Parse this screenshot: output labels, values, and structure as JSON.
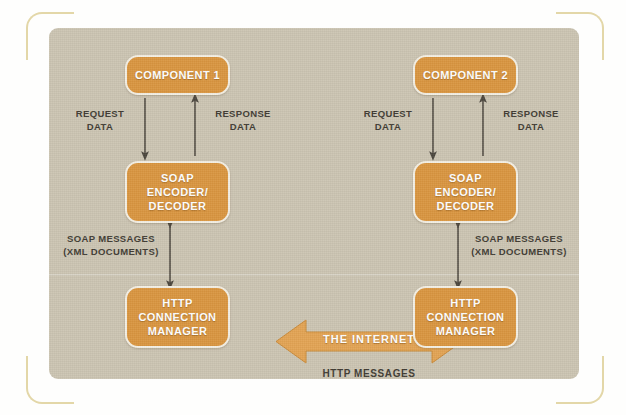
{
  "figure": {
    "background_color": "#cbc4b2",
    "node_color": "#d9953f",
    "node_border_color": "#f4efe3",
    "bracket_color": "#e3d7a8",
    "text_color": "#403b33",
    "node_text_color": "#ffffff"
  },
  "nodes": {
    "component_1": {
      "line1": "COMPONENT 1"
    },
    "component_2": {
      "line1": "COMPONENT 2"
    },
    "soap_left": {
      "line1": "SOAP",
      "line2": "ENCODER/",
      "line3": "DECODER"
    },
    "soap_right": {
      "line1": "SOAP",
      "line2": "ENCODER/",
      "line3": "DECODER"
    },
    "http_left": {
      "line1": "HTTP",
      "line2": "CONNECTION",
      "line3": "MANAGER"
    },
    "http_right": {
      "line1": "HTTP",
      "line2": "CONNECTION",
      "line3": "MANAGER"
    }
  },
  "labels": {
    "request_left": "REQUEST\nDATA",
    "response_left": "RESPONSE\nDATA",
    "request_right": "REQUEST\nDATA",
    "response_right": "RESPONSE\nDATA",
    "soap_messages_left": "SOAP MESSAGES\n(XML DOCUMENTS)",
    "soap_messages_right": "SOAP MESSAGES\n(XML DOCUMENTS)",
    "the_internet": "THE INTERNET",
    "http_messages": "HTTP MESSAGES"
  }
}
